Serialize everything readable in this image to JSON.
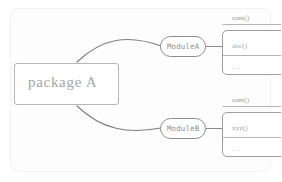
{
  "diagram": {
    "package": {
      "label": "package A"
    },
    "modules": [
      {
        "id": "module-a",
        "label": "ModuleA",
        "methods": [
          {
            "label": "sum()"
          },
          {
            "label": "abc()"
          },
          {
            "label": "..."
          }
        ]
      },
      {
        "id": "module-b",
        "label": "ModuleB",
        "methods": [
          {
            "label": "sum()"
          },
          {
            "label": "xyz()"
          },
          {
            "label": "..."
          }
        ]
      }
    ],
    "colors": {
      "card_background": "#fdfdfd",
      "card_border": "#f2f2f2",
      "stroke": "#8c8c8c",
      "light_stroke": "#bdbdbd",
      "text": "#9a9a9a",
      "page_background": "#ffffff"
    }
  }
}
